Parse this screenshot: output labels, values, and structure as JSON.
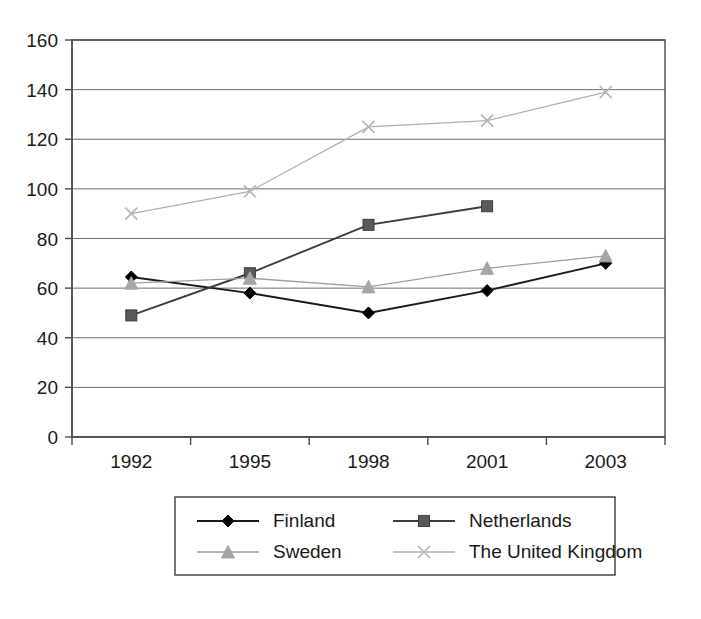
{
  "chart_data": {
    "type": "line",
    "title": "",
    "subtitle": "",
    "xlabel": "",
    "ylabel": "",
    "categories": [
      "1992",
      "1995",
      "1998",
      "2001",
      "2003"
    ],
    "ylim": [
      0,
      160
    ],
    "yticks": [
      "0",
      "20",
      "40",
      "60",
      "80",
      "100",
      "120",
      "140",
      "160"
    ],
    "ytick_values": [
      0,
      20,
      40,
      60,
      80,
      100,
      120,
      140,
      160
    ],
    "grid": true,
    "grid_axis": "y",
    "legend_position": "bottom",
    "series": [
      {
        "name": "Finland",
        "marker": "diamond",
        "color": "#000000",
        "line_color": "#1a1a1a",
        "values": [
          64.5,
          58,
          50,
          59,
          70
        ]
      },
      {
        "name": "Netherlands",
        "marker": "square",
        "color": "#595959",
        "line_color": "#3d3d3d",
        "values": [
          49,
          66,
          85.5,
          93,
          null
        ]
      },
      {
        "name": "Sweden",
        "marker": "triangle",
        "color": "#a6a6a6",
        "line_color": "#9e9e9e",
        "values": [
          62,
          64,
          60.5,
          68,
          73
        ]
      },
      {
        "name": "The United Kingdom",
        "marker": "cross",
        "color": "#b5b5b5",
        "line_color": "#b0b0b0",
        "values": [
          90,
          99,
          125,
          127.5,
          139
        ]
      }
    ]
  },
  "legend": {
    "entries": [
      {
        "label": "Finland"
      },
      {
        "label": "Netherlands"
      },
      {
        "label": "Sweden"
      },
      {
        "label": "The United Kingdom"
      }
    ]
  },
  "axes": {
    "y_tick_labels": [
      "160",
      "140",
      "120",
      "100",
      "80",
      "60",
      "40",
      "20",
      "0"
    ],
    "x_tick_labels": [
      "1992",
      "1995",
      "1998",
      "2001",
      "2003"
    ]
  }
}
